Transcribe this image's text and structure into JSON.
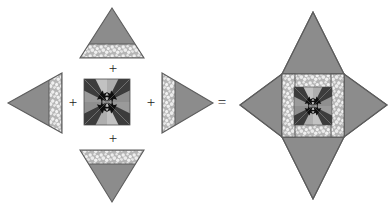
{
  "diagram": {
    "background_color": "#ffffff",
    "operators": [
      {
        "symbol": "+",
        "name": "plus-top",
        "x": 112,
        "y": 69
      },
      {
        "symbol": "+",
        "name": "plus-left",
        "x": 73,
        "y": 103
      },
      {
        "symbol": "+",
        "name": "plus-right",
        "x": 150,
        "y": 103
      },
      {
        "symbol": "+",
        "name": "plus-bottom",
        "x": 112,
        "y": 139
      },
      {
        "symbol": "=",
        "name": "equals",
        "x": 221,
        "y": 103
      }
    ],
    "palette": {
      "triangle_gray": "#8c8c8c",
      "triangle_outline": "#5d5d5d",
      "band_light": "#b9b9b9",
      "band_print_white": "#eeeeee",
      "block_dark": "#3a3a3a",
      "block_mid": "#6f6f6f",
      "block_light": "#a8a8a8",
      "block_pale": "#c6c6c6",
      "black_accent": "#111111",
      "outline": "#4a4a4a"
    },
    "pieces": [
      {
        "name": "top-triangle",
        "label": "Top setting triangle, point up, printed band at base",
        "orientation": "up",
        "cx": 112,
        "base_y": 58,
        "half_width": 32,
        "apex_y": 8,
        "band": {
          "position": "base",
          "thickness": 14
        }
      },
      {
        "name": "left-triangle",
        "label": "Left setting triangle, point left, printed band at right edge",
        "orientation": "left",
        "cy": 103,
        "base_x": 62,
        "half_height": 30,
        "apex_x": 8,
        "band": {
          "position": "base",
          "thickness": 13
        }
      },
      {
        "name": "center-square-block",
        "label": "Kaleidoscope pinwheel patchwork square",
        "x": 84,
        "y": 79,
        "size": 46
      },
      {
        "name": "right-triangle",
        "label": "Right setting triangle, point right, printed band at left edge",
        "orientation": "right",
        "cy": 103,
        "base_x": 162,
        "half_height": 30,
        "apex_x": 213,
        "band": {
          "position": "base",
          "thickness": 13
        }
      },
      {
        "name": "bottom-triangle",
        "label": "Bottom setting triangle, point down, printed band at top",
        "orientation": "down",
        "cx": 112,
        "base_y": 150,
        "half_width": 32,
        "apex_y": 202,
        "band": {
          "position": "base",
          "thickness": 14
        }
      },
      {
        "name": "result-star-block",
        "label": "Assembled four-pointed star block",
        "center_x": 313,
        "center_y": 105,
        "square_size": 62,
        "point_length": 62
      }
    ]
  }
}
